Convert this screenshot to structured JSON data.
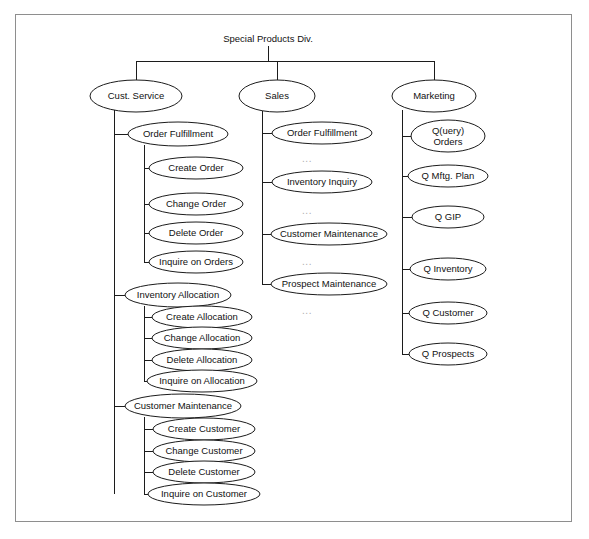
{
  "diagram": {
    "title": "Special Products Div.",
    "root": {
      "label": "Special Products Div.",
      "cx": 268,
      "cy": 38
    },
    "columns": [
      {
        "name": "cust-service",
        "header": {
          "label": "Cust. Service",
          "cx": 136,
          "cy": 96,
          "rx": 46,
          "ry": 16
        },
        "bus_x": 114,
        "groups": [
          {
            "name": "order-fulfillment",
            "parent": {
              "label": "Order Fulfillment",
              "cx": 178,
              "cy": 134,
              "rx": 50,
              "ry": 12
            },
            "bus_x": 144,
            "children": [
              {
                "label": "Create Order",
                "cx": 196,
                "cy": 168,
                "rx": 47,
                "ry": 11
              },
              {
                "label": "Change Order",
                "cx": 196,
                "cy": 204,
                "rx": 47,
                "ry": 11
              },
              {
                "label": "Delete Order",
                "cx": 196,
                "cy": 233,
                "rx": 47,
                "ry": 11
              },
              {
                "label": "Inquire on Orders",
                "cx": 196,
                "cy": 262,
                "rx": 47,
                "ry": 11
              }
            ]
          },
          {
            "name": "inventory-allocation",
            "parent": {
              "label": "Inventory Allocation",
              "cx": 178,
              "cy": 295,
              "rx": 53,
              "ry": 12
            },
            "bus_x": 144,
            "children": [
              {
                "label": "Create Allocation",
                "cx": 202,
                "cy": 317,
                "rx": 50,
                "ry": 11
              },
              {
                "label": "Change Allocation",
                "cx": 202,
                "cy": 338,
                "rx": 50,
                "ry": 11
              },
              {
                "label": "Delete Allocation",
                "cx": 202,
                "cy": 360,
                "rx": 50,
                "ry": 11
              },
              {
                "label": "Inquire on Allocation",
                "cx": 202,
                "cy": 381,
                "rx": 55,
                "ry": 11
              }
            ]
          },
          {
            "name": "customer-maintenance",
            "parent": {
              "label": "Customer Maintenance",
              "cx": 183,
              "cy": 406,
              "rx": 58,
              "ry": 12
            },
            "bus_x": 144,
            "children": [
              {
                "label": "Create Customer",
                "cx": 204,
                "cy": 429,
                "rx": 51,
                "ry": 11
              },
              {
                "label": "Change Customer",
                "cx": 204,
                "cy": 451,
                "rx": 51,
                "ry": 11
              },
              {
                "label": "Delete Customer",
                "cx": 204,
                "cy": 472,
                "rx": 51,
                "ry": 11
              },
              {
                "label": "Inquire on Customer",
                "cx": 204,
                "cy": 494,
                "rx": 56,
                "ry": 11
              }
            ]
          }
        ]
      },
      {
        "name": "sales",
        "header": {
          "label": "Sales",
          "cx": 277,
          "cy": 96,
          "rx": 38,
          "ry": 16
        },
        "bus_x": 262,
        "groups": [
          {
            "name": "sales-functions",
            "parent": null,
            "bus_x": 262,
            "children": [
              {
                "label": "Order Fulfillment",
                "cx": 322,
                "cy": 133,
                "rx": 50,
                "ry": 11
              },
              {
                "label": "Inventory Inquiry",
                "cx": 322,
                "cy": 182,
                "rx": 50,
                "ry": 11
              },
              {
                "label": "Customer Maintenance",
                "cx": 329,
                "cy": 234,
                "rx": 58,
                "ry": 11
              },
              {
                "label": "Prospect Maintenance",
                "cx": 329,
                "cy": 284,
                "rx": 58,
                "ry": 11
              }
            ]
          }
        ]
      },
      {
        "name": "marketing",
        "header": {
          "label": "Marketing",
          "cx": 434,
          "cy": 96,
          "rx": 42,
          "ry": 16
        },
        "bus_x": 402,
        "groups": [
          {
            "name": "marketing-queries",
            "parent": null,
            "bus_x": 402,
            "children": [
              {
                "label": "Q(uery)\nOrders",
                "cx": 448,
                "cy": 136,
                "rx": 37,
                "ry": 16
              },
              {
                "label": "Q Mftg. Plan",
                "cx": 448,
                "cy": 176,
                "rx": 40,
                "ry": 11
              },
              {
                "label": "Q GIP",
                "cx": 448,
                "cy": 217,
                "rx": 36,
                "ry": 11
              },
              {
                "label": "Q Inventory",
                "cx": 448,
                "cy": 269,
                "rx": 38,
                "ry": 11
              },
              {
                "label": "Q Customer",
                "cx": 448,
                "cy": 313,
                "rx": 39,
                "ry": 11
              },
              {
                "label": "Q Prospects",
                "cx": 448,
                "cy": 354,
                "rx": 39,
                "ry": 11
              }
            ]
          }
        ]
      }
    ],
    "ellipses_marks": [
      {
        "label": "...",
        "cx": 307,
        "cy": 158
      },
      {
        "label": "...",
        "cx": 307,
        "cy": 210
      },
      {
        "label": "...",
        "cx": 307,
        "cy": 261
      },
      {
        "label": "...",
        "cx": 307,
        "cy": 310
      }
    ],
    "colors": {
      "frame": "#8e8e8e",
      "stroke": "#1c1c1c",
      "text": "#111111",
      "ellipsis": "#aeaeae",
      "background": "#ffffff"
    }
  }
}
